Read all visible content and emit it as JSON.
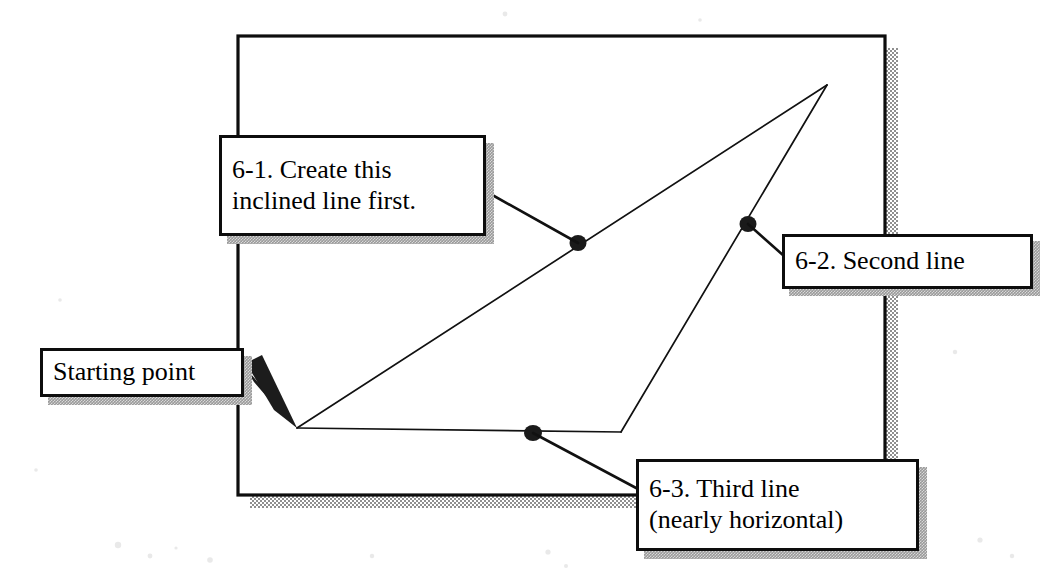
{
  "figure": {
    "kind": "cad-line-construction-diagram",
    "background_color": "#ffffff",
    "ink_color": "#000000",
    "shadow_color": "#9a9a9a"
  },
  "frame": {
    "name": "drawing-area-border",
    "x": 238,
    "y": 36,
    "width": 647,
    "height": 459,
    "border_px": 3,
    "shadow_offset_px": 12,
    "shadow_thickness_px": 12
  },
  "geometry": {
    "start_vertex": {
      "x": 297,
      "y": 428
    },
    "apex_vertex": {
      "x": 827,
      "y": 85
    },
    "lower_right_vertex": {
      "x": 621,
      "y": 432
    },
    "segments": [
      {
        "label": "6-1 inclined line",
        "from": [
          297,
          428
        ],
        "to": [
          827,
          85
        ]
      },
      {
        "label": "6-2 second line",
        "from": [
          827,
          85
        ],
        "to": [
          621,
          432
        ]
      },
      {
        "label": "6-3 third line (nearly horizontal)",
        "from": [
          621,
          432
        ],
        "to": [
          297,
          428
        ]
      }
    ],
    "nodes": [
      {
        "name": "node-on-inclined-line",
        "x": 578,
        "y": 243
      },
      {
        "name": "node-on-second-line",
        "x": 748,
        "y": 224
      },
      {
        "name": "node-on-third-line",
        "x": 533,
        "y": 433
      }
    ]
  },
  "callouts": {
    "six_one": {
      "text": "6-1. Create this\ninclined line first.",
      "leader_from": [
        487,
        192
      ],
      "leader_to": [
        578,
        243
      ]
    },
    "six_two": {
      "text": "6-2. Second line",
      "leader_from": [
        782,
        254
      ],
      "leader_to": [
        748,
        224
      ]
    },
    "six_three": {
      "text": "6-3. Third line\n(nearly horizontal)",
      "leader_from": [
        636,
        487
      ],
      "leader_to": [
        533,
        433
      ]
    },
    "starting_point": {
      "text": "Starting point",
      "arrow_from": [
        246,
        372
      ],
      "arrow_to": [
        297,
        428
      ]
    }
  }
}
